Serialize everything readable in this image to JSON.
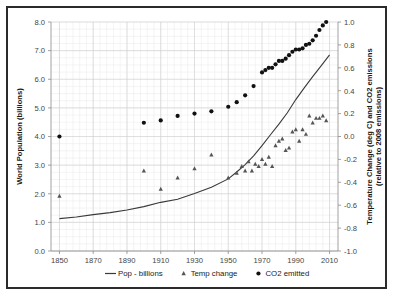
{
  "chart_data": {
    "type": "line",
    "title": "",
    "xlabel": "",
    "ylabel": "World Population (billions)",
    "y2label": "Temperature Change (deg C) and CO2 emissions (relative to 2008 emissions)",
    "y2label_line1": "Temperature Change (deg C) and CO2 emissions",
    "y2label_line2": "(relative to 2008 emissions)",
    "xlim": [
      1845,
      2015
    ],
    "ylim": [
      0.0,
      8.0
    ],
    "y2lim": [
      -1.0,
      1.0
    ],
    "xticks": [
      1850,
      1870,
      1890,
      1910,
      1930,
      1950,
      1970,
      1990,
      2010
    ],
    "xtick_labels": [
      "1850",
      "1870",
      "1890",
      "1910",
      "1930",
      "1950",
      "1970",
      "1990",
      "2010"
    ],
    "yticks": [
      0.0,
      1.0,
      2.0,
      3.0,
      4.0,
      5.0,
      6.0,
      7.0,
      8.0
    ],
    "ytick_labels": [
      "0.0",
      "1.0",
      "2.0",
      "3.0",
      "4.0",
      "5.0",
      "6.0",
      "7.0",
      "8.0"
    ],
    "y2ticks": [
      -1.0,
      -0.8,
      -0.6,
      -0.4,
      -0.2,
      0.0,
      0.2,
      0.4,
      0.6,
      0.8,
      1.0
    ],
    "y2tick_labels": [
      "-1.0",
      "-0.8",
      "-0.6",
      "-0.4",
      "-0.2",
      "0.0",
      "0.2",
      "0.4",
      "0.6",
      "0.8",
      "1.0"
    ],
    "grid": true,
    "grid_minor": true,
    "legend_position": "bottom",
    "series": [
      {
        "name": "Pop - billions",
        "label": "Pop - billions",
        "type": "line",
        "axis": "left",
        "marker": "none",
        "color": "#3a3a3a",
        "x": [
          1850,
          1860,
          1870,
          1880,
          1890,
          1900,
          1910,
          1920,
          1930,
          1940,
          1950,
          1955,
          1960,
          1965,
          1970,
          1975,
          1980,
          1985,
          1990,
          1995,
          2000,
          2005,
          2010
        ],
        "y": [
          1.13,
          1.19,
          1.27,
          1.34,
          1.43,
          1.55,
          1.7,
          1.81,
          2.01,
          2.23,
          2.52,
          2.76,
          3.02,
          3.32,
          3.68,
          4.06,
          4.43,
          4.83,
          5.29,
          5.7,
          6.09,
          6.47,
          6.85
        ]
      },
      {
        "name": "Temp change",
        "label": "Temp change",
        "type": "scatter",
        "axis": "right",
        "marker": "triangle",
        "color": "#555555",
        "x": [
          1850,
          1900,
          1910,
          1920,
          1930,
          1940,
          1950,
          1955,
          1958,
          1960,
          1962,
          1964,
          1966,
          1968,
          1970,
          1972,
          1974,
          1976,
          1978,
          1980,
          1982,
          1984,
          1986,
          1988,
          1990,
          1992,
          1994,
          1996,
          1998,
          2000,
          2002,
          2004,
          2006,
          2008
        ],
        "y": [
          -0.52,
          -0.3,
          -0.46,
          -0.36,
          -0.28,
          -0.16,
          -0.36,
          -0.32,
          -0.26,
          -0.3,
          -0.22,
          -0.3,
          -0.24,
          -0.26,
          -0.2,
          -0.24,
          -0.18,
          -0.26,
          -0.08,
          -0.04,
          -0.02,
          -0.12,
          -0.1,
          0.04,
          0.06,
          -0.04,
          0.06,
          0.02,
          0.18,
          0.12,
          0.16,
          0.16,
          0.18,
          0.14
        ]
      },
      {
        "name": "CO2 emitted",
        "label": "CO2 emitted",
        "type": "scatter",
        "axis": "right",
        "marker": "circle",
        "color": "#111111",
        "x": [
          1850,
          1900,
          1910,
          1920,
          1930,
          1940,
          1950,
          1955,
          1960,
          1965,
          1970,
          1972,
          1974,
          1976,
          1978,
          1980,
          1982,
          1984,
          1986,
          1988,
          1990,
          1992,
          1994,
          1996,
          1998,
          2000,
          2002,
          2004,
          2006,
          2008
        ],
        "y": [
          0.0,
          0.12,
          0.14,
          0.18,
          0.2,
          0.22,
          0.26,
          0.3,
          0.36,
          0.44,
          0.56,
          0.58,
          0.6,
          0.6,
          0.63,
          0.66,
          0.66,
          0.68,
          0.71,
          0.74,
          0.76,
          0.76,
          0.77,
          0.8,
          0.81,
          0.84,
          0.88,
          0.93,
          0.97,
          1.0
        ]
      }
    ]
  },
  "legend": {
    "items": [
      {
        "label": "Pop - billions",
        "marker": "line"
      },
      {
        "label": "Temp change",
        "marker": "triangle"
      },
      {
        "label": "CO2 emitted",
        "marker": "circle"
      }
    ]
  },
  "axes": {
    "left_title": "World Population (billions)",
    "right_title_line1": "Temperature Change (deg C) and CO2 emissions",
    "right_title_line2": "(relative to 2008 emissions)"
  },
  "colors": {
    "pop_line": "#3a3a3a",
    "temp_marker": "#555555",
    "co2_marker": "#111111",
    "frame": "#2b2b2b",
    "grid_minor": "#e9e9e9",
    "grid_major": "#d0d0d0"
  }
}
